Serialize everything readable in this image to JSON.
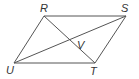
{
  "diagram": {
    "type": "parallelogram",
    "stroke_color": "#555555",
    "label_color": "#333333",
    "vertices": {
      "R": {
        "label": "R",
        "x": 44,
        "y": 16
      },
      "S": {
        "label": "S",
        "x": 126,
        "y": 16
      },
      "T": {
        "label": "T",
        "x": 95,
        "y": 63
      },
      "U": {
        "label": "U",
        "x": 14,
        "y": 63
      }
    },
    "intersection": {
      "label": "V",
      "x": 70,
      "y": 40
    },
    "sides": [
      "RS",
      "ST",
      "TU",
      "UR"
    ],
    "diagonals": [
      "RT",
      "SU"
    ]
  }
}
